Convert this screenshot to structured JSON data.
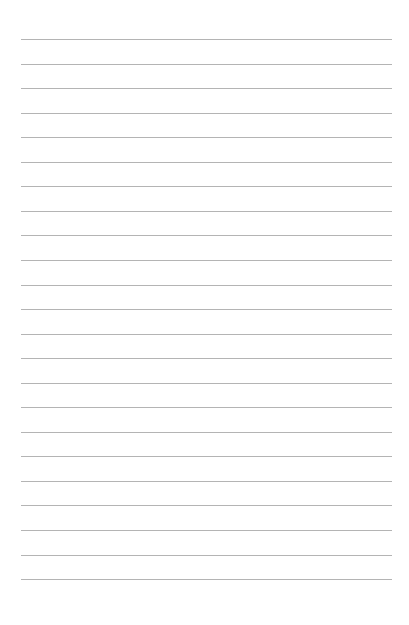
{
  "page": {
    "type": "lined-paper",
    "background_color": "#ffffff",
    "rule_color": "#b4b4b4",
    "rule_count": 23,
    "first_rule_y": 39,
    "rule_spacing": 24.55,
    "rule_left": 21,
    "rule_right": 392,
    "text": ""
  }
}
